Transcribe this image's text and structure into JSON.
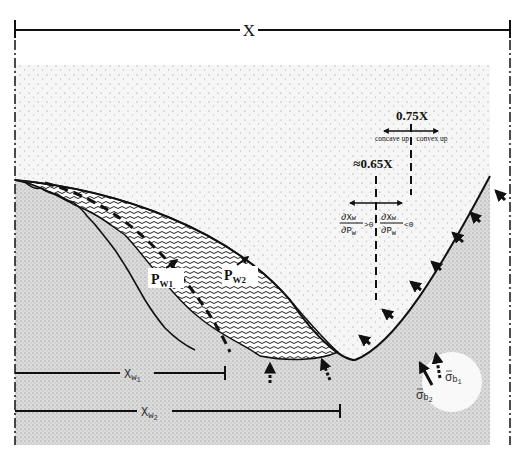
{
  "labels": {
    "x_total": "X",
    "x_075": "0.75X",
    "x_065": "≈0.65X",
    "concave_up": "concave up",
    "convex_up": "convex up",
    "deriv_num": "∂X",
    "deriv_num_sub": "w",
    "deriv_den": "∂P",
    "deriv_den_sub": "w",
    "deriv_pos": ">0",
    "deriv_neg": "<0",
    "pw1": "P",
    "pw1_sub": "W1",
    "pw2": "P",
    "pw2_sub": "W2",
    "xw1": "X",
    "xw1_sub": "w",
    "xw1_subsub": "1",
    "xw2": "X",
    "xw2_sub": "w",
    "xw2_subsub": "2",
    "sigma_b1": "σ",
    "sigma_b1_sub": "b",
    "sigma_b1_subsub": "1",
    "sigma_b2": "σ",
    "sigma_b2_sub": "b",
    "sigma_b2_subsub": "2"
  },
  "colors": {
    "ink": "#111111",
    "sky_fill": "#f4f4f4",
    "ground_fill": "#d9d9d9",
    "water_fill": "#9a9a9a",
    "background": "#ffffff"
  }
}
